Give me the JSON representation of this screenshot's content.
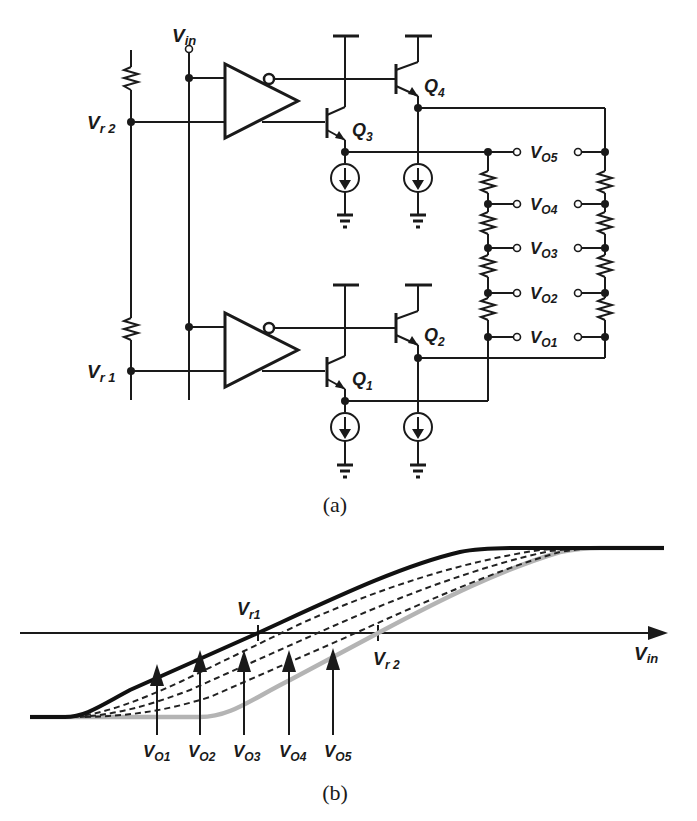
{
  "figure_a": {
    "caption": "(a)",
    "input_label": {
      "main": "V",
      "sub": "in"
    },
    "reference_labels": [
      {
        "main": "V",
        "sub": "r 2"
      },
      {
        "main": "V",
        "sub": "r 1"
      }
    ],
    "transistors": [
      {
        "main": "Q",
        "sub": "1"
      },
      {
        "main": "Q",
        "sub": "2"
      },
      {
        "main": "Q",
        "sub": "3"
      },
      {
        "main": "Q",
        "sub": "4"
      }
    ],
    "outputs": [
      {
        "main": "V",
        "sub": "O5"
      },
      {
        "main": "V",
        "sub": "O4"
      },
      {
        "main": "V",
        "sub": "O3"
      },
      {
        "main": "V",
        "sub": "O2"
      },
      {
        "main": "V",
        "sub": "O1"
      }
    ]
  },
  "figure_b": {
    "caption": "(b)",
    "x_axis_label": {
      "main": "V",
      "sub": "in"
    },
    "ticks": [
      {
        "main": "V",
        "sub": "r1"
      },
      {
        "main": "V",
        "sub": "r 2"
      }
    ],
    "arrow_labels": [
      {
        "main": "V",
        "sub": "O1"
      },
      {
        "main": "V",
        "sub": "O2"
      },
      {
        "main": "V",
        "sub": "O3"
      },
      {
        "main": "V",
        "sub": "O4"
      },
      {
        "main": "V",
        "sub": "O5"
      }
    ],
    "colors": {
      "top_curve": "#111111",
      "bottom_curve": "#b4b4b4",
      "interpolated_curves": "#222222"
    }
  }
}
